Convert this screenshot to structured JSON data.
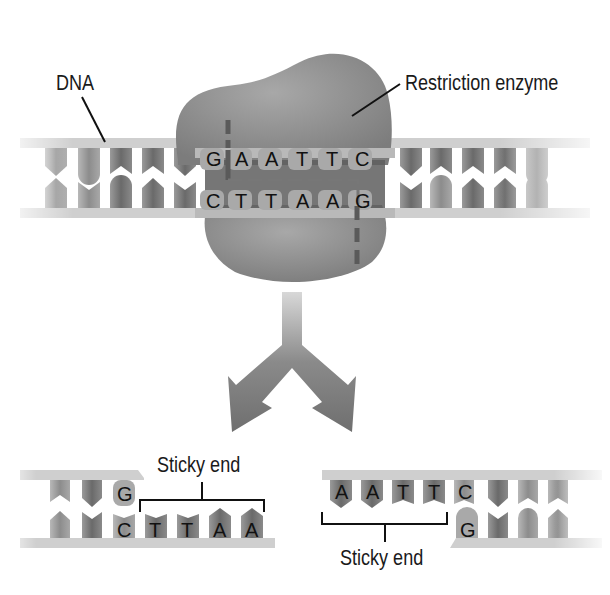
{
  "labels": {
    "dna": "DNA",
    "enzyme": "Restriction enzyme",
    "sticky_left": "Sticky end",
    "sticky_right": "Sticky end"
  },
  "recognition_site": {
    "top": [
      "G",
      "A",
      "A",
      "T",
      "T",
      "C"
    ],
    "bottom": [
      "C",
      "T",
      "T",
      "A",
      "A",
      "G"
    ]
  },
  "fragment_left": {
    "top": [
      "G"
    ],
    "bottom": [
      "C",
      "T",
      "T",
      "A",
      "A"
    ]
  },
  "fragment_right": {
    "top": [
      "A",
      "A",
      "T",
      "T",
      "C"
    ],
    "bottom": [
      "G"
    ]
  },
  "colors": {
    "backbone": "#c9c9c9",
    "base_dark": "#6e6e6e",
    "base_mid": "#8e8e8e",
    "base_light": "#a8a8a8",
    "enzyme": "#8f8f8f",
    "cut_line": "#5a5a5a",
    "arrow": "#7a7a7a"
  }
}
